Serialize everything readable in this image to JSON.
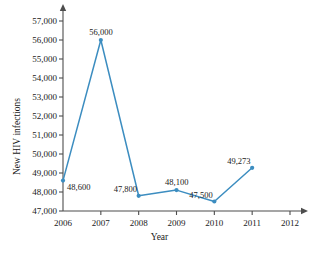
{
  "chart_data": {
    "type": "line",
    "title": "",
    "xlabel": "Year",
    "ylabel": "New HIV infections",
    "x": [
      2006,
      2007,
      2008,
      2009,
      2010,
      2011
    ],
    "values": [
      48600,
      56000,
      47800,
      48100,
      47500,
      49273
    ],
    "point_labels": [
      "48,600",
      "56,000",
      "47,800",
      "48,100",
      "47,500",
      "49,273"
    ],
    "xlim": [
      2006,
      2012
    ],
    "ylim": [
      47000,
      57000
    ],
    "x_ticks": [
      2006,
      2007,
      2008,
      2009,
      2010,
      2011,
      2012
    ],
    "x_tick_labels": [
      "2006",
      "2007",
      "2008",
      "2009",
      "2010",
      "2011",
      "2012"
    ],
    "y_ticks": [
      47000,
      48000,
      49000,
      50000,
      51000,
      52000,
      53000,
      54000,
      55000,
      56000,
      57000
    ],
    "y_tick_labels": [
      "47,000",
      "48,000",
      "49,000",
      "50,000",
      "51,000",
      "52,000",
      "53,000",
      "54,000",
      "55,000",
      "56,000",
      "57,000"
    ],
    "grid": false,
    "legend": "none",
    "series_color": "#3C8DC0",
    "axis_color": "#4d4d4d",
    "marker": "circle",
    "label_positions": [
      "right",
      "above",
      "above-left",
      "above",
      "above-left",
      "above-left"
    ]
  }
}
